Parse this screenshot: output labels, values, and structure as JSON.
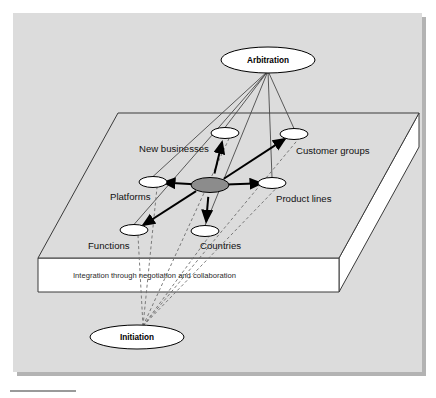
{
  "figure": {
    "panel_bg": "#dcdcdc",
    "panel_shadow": "#b3b3b3",
    "slab_top_fill": "#dcdcdc",
    "slab_face_fill": "#ffffff",
    "outline_color": "#3a3a3a",
    "hub_fill": "#8c8c8c",
    "node_fill": "#ffffff",
    "arrow_color": "#000000",
    "thin_line_color": "#4a4a4a",
    "dashed_line_color": "#6e6e6e",
    "rule_color": "#9a9a9a"
  },
  "hubs": {
    "top": {
      "label": "Arbitration",
      "cx": 268,
      "cy": 60,
      "rx": 47,
      "ry": 13
    },
    "bottom": {
      "label": "Initiation",
      "cx": 137,
      "cy": 337,
      "rx": 47,
      "ry": 12
    }
  },
  "center_node": {
    "name": "central-hub",
    "cx": 210,
    "cy": 185,
    "rx": 19,
    "ry": 7.5
  },
  "nodes": [
    {
      "id": "new-businesses",
      "label": "New businesses",
      "cx": 225,
      "cy": 133,
      "rx": 14,
      "ry": 5.5,
      "label_x": 139,
      "label_y": 152,
      "label_anchor": "start"
    },
    {
      "id": "customer-groups",
      "label": "Customer groups",
      "cx": 294,
      "cy": 134,
      "rx": 14,
      "ry": 5.5,
      "label_x": 296,
      "label_y": 154,
      "label_anchor": "start"
    },
    {
      "id": "platforms",
      "label": "Platforms",
      "cx": 153,
      "cy": 182,
      "rx": 14,
      "ry": 5.5,
      "label_x": 110,
      "label_y": 200,
      "label_anchor": "start"
    },
    {
      "id": "product-lines",
      "label": "Product lines",
      "cx": 272,
      "cy": 183,
      "rx": 14,
      "ry": 5.5,
      "label_x": 276,
      "label_y": 202,
      "label_anchor": "start"
    },
    {
      "id": "functions",
      "label": "Functions",
      "cx": 134,
      "cy": 230,
      "rx": 14,
      "ry": 5.5,
      "label_x": 88,
      "label_y": 249,
      "label_anchor": "start"
    },
    {
      "id": "countries",
      "label": "Countries",
      "cx": 205,
      "cy": 231,
      "rx": 14,
      "ry": 5.5,
      "label_x": 200,
      "label_y": 249,
      "label_anchor": "start"
    }
  ],
  "slab": {
    "caption": "Integration through negotiation and collaboration",
    "caption_x": 73,
    "caption_y": 278,
    "top_face": "118,113 419,113 339,258 38,258",
    "front_face": "38,258 339,258 339,292 38,292",
    "right_face": "339,258 419,113 419,147 339,292"
  },
  "bottom_rule": {
    "x": 10,
    "y": 390,
    "width": 66,
    "height": 2
  }
}
